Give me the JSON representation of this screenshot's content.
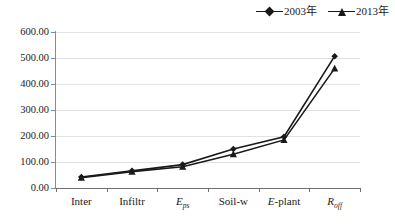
{
  "legend": {
    "position": "top-right",
    "entries": [
      {
        "label": "2003年",
        "marker": "diamond",
        "color": "#1a1a1a"
      },
      {
        "label": "2013年",
        "marker": "triangle",
        "color": "#1a1a1a"
      }
    ]
  },
  "axes": {
    "y_ticks": [
      "0.00",
      "100.00",
      "200.00",
      "300.00",
      "400.00",
      "500.00",
      "600.00"
    ],
    "x_ticks": [
      "Inter",
      "Infiltr",
      "Eps",
      "Soil-w",
      "E-plant",
      "Roff"
    ]
  },
  "chart_data": {
    "type": "line",
    "title": "",
    "xlabel": "",
    "ylabel": "",
    "ylim": [
      0,
      600
    ],
    "ytick_values": [
      0,
      100,
      200,
      300,
      400,
      500,
      600
    ],
    "grid": true,
    "legend_position": "top-right",
    "categories": [
      "Inter",
      "Eps",
      "Soil-w",
      "E-plant",
      "Roff",
      "Infiltr"
    ],
    "category_order": [
      "Inter",
      "Infiltr",
      "Eps",
      "Soil-w",
      "E-plant",
      "Roff"
    ],
    "category_labels": [
      {
        "text": "Inter",
        "base": "Inter",
        "sub": ""
      },
      {
        "text": "Infiltr",
        "base": "Infiltr",
        "sub": ""
      },
      {
        "text": "Eps",
        "base": "E",
        "sub": "ps"
      },
      {
        "text": "Soil-w",
        "base": "Soil-w",
        "sub": ""
      },
      {
        "text": "E-plant",
        "base": "E",
        "sub": "",
        "suffix": "-plant"
      },
      {
        "text": "Roff",
        "base": "R",
        "sub": "off"
      }
    ],
    "series": [
      {
        "name": "2003年",
        "marker": "diamond",
        "color": "#1a1a1a",
        "values": [
          42,
          66,
          90,
          150,
          197,
          507
        ]
      },
      {
        "name": "2013年",
        "marker": "triangle",
        "color": "#1a1a1a",
        "values": [
          40,
          63,
          82,
          130,
          185,
          460
        ]
      }
    ]
  }
}
